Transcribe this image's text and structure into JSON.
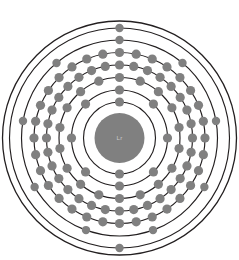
{
  "diagram": {
    "kind": "bohr-model-atom",
    "background_color": "#ffffff",
    "ring_color": "#231f20",
    "electron_color": "#808080",
    "nucleus_color": "#808080",
    "nucleus_label_color": "#d8d8d8",
    "center_x": 119.5,
    "center_y": 138.0,
    "nucleus": {
      "label": "Lr",
      "radius": 25.0
    },
    "outer_boundary": {
      "radius": 117.0
    },
    "shells": [
      {
        "name": "K",
        "index": 1,
        "radius": 36.0,
        "electrons": 2,
        "start_angle": -90
      },
      {
        "name": "L",
        "index": 2,
        "radius": 48.0,
        "electrons": 8,
        "start_angle": -90
      },
      {
        "name": "M",
        "index": 3,
        "radius": 60.5,
        "electrons": 18,
        "start_angle": -90
      },
      {
        "name": "N",
        "index": 4,
        "radius": 73.0,
        "electrons": 32,
        "start_angle": -90
      },
      {
        "name": "O",
        "index": 5,
        "radius": 85.5,
        "electrons": 32,
        "start_angle": -90
      },
      {
        "name": "P",
        "index": 6,
        "radius": 98.0,
        "electrons": 9,
        "start_angle": -90
      },
      {
        "name": "Q",
        "index": 7,
        "radius": 110.0,
        "electrons": 2,
        "start_angle": -90
      }
    ],
    "electron_radius": 4.6,
    "electron_radius_outer": 4.2
  },
  "chart_data": {
    "type": "scatter",
    "xlabel": "Electron shell",
    "ylabel": "Number of electrons",
    "categories": [
      "K",
      "L",
      "M",
      "N",
      "O",
      "P",
      "Q"
    ],
    "values": [
      2,
      8,
      18,
      32,
      32,
      9,
      2
    ],
    "total_electrons": 103,
    "legend": [],
    "grid": false
  }
}
